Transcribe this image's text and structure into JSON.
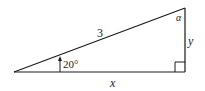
{
  "diagram": {
    "type": "right-triangle",
    "hypotenuse_label": "3",
    "angle_label": "20°",
    "top_angle_label": "α",
    "vertical_side_label": "y",
    "horizontal_side_label": "x",
    "right_angle_marker": true,
    "stroke_color": "#1a1a1a",
    "background_color": "#ffffff"
  }
}
